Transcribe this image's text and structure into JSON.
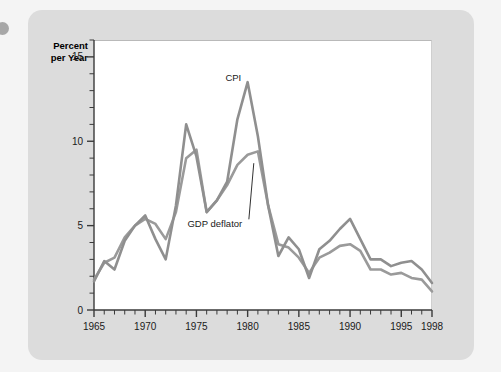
{
  "figure": {
    "axis_title": "Percent\nper Year",
    "background_color": "#dcdcdc",
    "plot_background_color": "#ffffff",
    "line_color_cpi": "#8f8f8f",
    "line_color_gdp": "#9a9a9a"
  },
  "chart_data": {
    "type": "line",
    "title": "",
    "subtitle": "",
    "xlabel": "",
    "ylabel": "Percent per Year",
    "xlim": [
      1965,
      1998
    ],
    "ylim": [
      0,
      16
    ],
    "yticks": [
      0,
      5,
      10,
      15
    ],
    "ytick_labels": [
      "0",
      "5",
      "10",
      "15"
    ],
    "y_minor_tick_step": 1,
    "xticks": [
      1965,
      1970,
      1975,
      1980,
      1985,
      1990,
      1995,
      1998
    ],
    "xtick_labels": [
      "1965",
      "1970",
      "1975",
      "1980",
      "1985",
      "1990",
      "1995",
      "1998"
    ],
    "x_minor_tick_step": 1,
    "grid": false,
    "legend_position": "inline-annotation",
    "annotations": [
      {
        "text": "CPI",
        "x": 1978.6,
        "y": 13.6,
        "leader": false
      },
      {
        "text": "GDP deflator",
        "x": 1976.8,
        "y": 4.9,
        "leader": true,
        "leader_to_x": 1980.6,
        "leader_to_y": 8.7
      }
    ],
    "x": [
      1965,
      1966,
      1967,
      1968,
      1969,
      1970,
      1971,
      1972,
      1973,
      1974,
      1975,
      1976,
      1977,
      1978,
      1979,
      1980,
      1981,
      1982,
      1983,
      1984,
      1985,
      1986,
      1987,
      1988,
      1989,
      1990,
      1991,
      1992,
      1993,
      1994,
      1995,
      1996,
      1997,
      1998
    ],
    "series": [
      {
        "name": "CPI",
        "color": "#8f8f8f",
        "values": [
          1.7,
          2.9,
          2.4,
          4.1,
          5.0,
          5.6,
          4.2,
          3.0,
          6.2,
          11.0,
          9.1,
          5.8,
          6.5,
          7.6,
          11.3,
          13.5,
          10.3,
          6.2,
          3.2,
          4.3,
          3.6,
          1.9,
          3.6,
          4.1,
          4.8,
          5.4,
          4.2,
          3.0,
          3.0,
          2.6,
          2.8,
          2.9,
          2.4,
          1.6
        ]
      },
      {
        "name": "GDP deflator",
        "color": "#9a9a9a",
        "values": [
          1.8,
          2.8,
          3.1,
          4.3,
          5.0,
          5.4,
          5.1,
          4.2,
          5.8,
          9.0,
          9.5,
          5.8,
          6.5,
          7.4,
          8.6,
          9.2,
          9.4,
          6.2,
          3.9,
          3.7,
          3.1,
          2.2,
          3.1,
          3.4,
          3.8,
          3.9,
          3.5,
          2.4,
          2.4,
          2.1,
          2.2,
          1.9,
          1.8,
          1.1
        ]
      }
    ]
  }
}
